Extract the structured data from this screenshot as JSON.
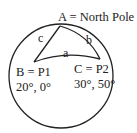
{
  "diagram": {
    "vertices": {
      "A": {
        "label": "A = North Pole"
      },
      "B": {
        "label": "B = P1",
        "coords": "20°, 0°"
      },
      "C": {
        "label": "C = P2",
        "coords": "30°, 50°"
      }
    },
    "sides": {
      "a": "a",
      "b": "b",
      "c": "c"
    },
    "colors": {
      "stroke": "#222222",
      "background": "#ffffff"
    }
  }
}
